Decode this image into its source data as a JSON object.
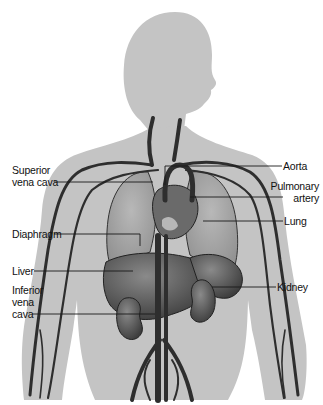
{
  "diagram": {
    "title": "",
    "colors": {
      "background": "#ffffff",
      "body_silhouette": "#c4c4c4",
      "vessel_dark": "#3a3a3a",
      "organ_dark": "#555555",
      "lung_fill": "#a9a9a9",
      "label_text": "#111111",
      "leader_line": "#1a1a1a"
    },
    "labels_left": [
      {
        "id": "superior-vena-cava",
        "lines": [
          "Superior",
          "vena cava"
        ]
      },
      {
        "id": "diaphragm",
        "lines": [
          "Diaphragm"
        ]
      },
      {
        "id": "liver",
        "lines": [
          "Liver"
        ]
      },
      {
        "id": "inferior-vena-cava",
        "lines": [
          "Inferior",
          "vena",
          "cava"
        ]
      }
    ],
    "labels_right": [
      {
        "id": "aorta",
        "lines": [
          "Aorta"
        ]
      },
      {
        "id": "pulmonary-artery",
        "lines": [
          "Pulmonary",
          "artery"
        ]
      },
      {
        "id": "lung",
        "lines": [
          "Lung"
        ]
      },
      {
        "id": "kidney",
        "lines": [
          "Kidney"
        ]
      }
    ]
  }
}
